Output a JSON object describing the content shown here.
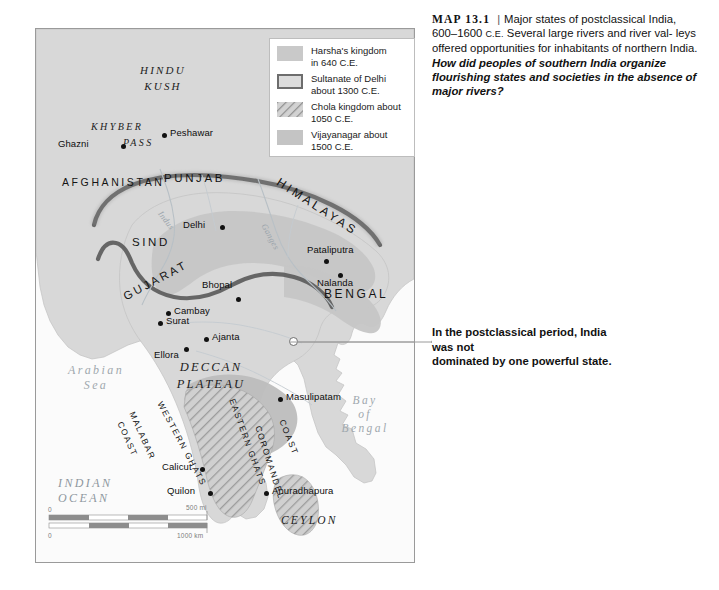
{
  "caption": {
    "map_number": "MAP 13.1",
    "divider": "|",
    "line1": "Major states of postclassical",
    "line2_a": "India, 600–1600 ",
    "line2_era": "C.E.",
    "line2_b": " Several large rivers and river val-",
    "line3": "leys offered opportunities for inhabitants of northern",
    "line4_a": "India. ",
    "question": "How did peoples of southern India organize flourishing states and societies in the absence of major rivers?"
  },
  "legend": {
    "items": [
      {
        "swatch": "solid-gray-fill",
        "line1": "Harsha's kingdom",
        "line2": "in 640 C.E."
      },
      {
        "swatch": "dark-outlined-box",
        "line1": "Sultanate of Delhi",
        "line2": "about 1300 C.E."
      },
      {
        "swatch": "diagonal-hatch",
        "line1": "Chola kingdom about",
        "line2": "1050 C.E."
      },
      {
        "swatch": "solid-gray-fill",
        "line1": "Vijayanagar about",
        "line2": "1500 C.E."
      }
    ]
  },
  "annotation": {
    "line1": "In the postclassical period, India was not",
    "line2": "dominated by one powerful state."
  },
  "map": {
    "regions": [
      {
        "name": "hindu-kush",
        "line1": "HINDU",
        "line2": "KUSH"
      },
      {
        "name": "deccan-plateau",
        "line1": "DECCAN",
        "line2": "PLATEAU"
      },
      {
        "name": "khyber-pass",
        "line1": "KHYBER",
        "line2": "PASS"
      },
      {
        "name": "ceylon",
        "line1": "CEYLON"
      }
    ],
    "provinces": [
      {
        "name": "afghanistan",
        "label": "AFGHANISTAN"
      },
      {
        "name": "punjab",
        "label": "PUNJAB"
      },
      {
        "name": "sind",
        "label": "SIND"
      },
      {
        "name": "gujarat",
        "label": "GUJARAT"
      },
      {
        "name": "bengal",
        "label": "BENGAL"
      },
      {
        "name": "himalayas",
        "label": "HIMALAYAS"
      }
    ],
    "cities": [
      {
        "name": "peshawar",
        "label": "Peshawar"
      },
      {
        "name": "ghazni",
        "label": "Ghazni"
      },
      {
        "name": "delhi",
        "label": "Delhi"
      },
      {
        "name": "pataliputra",
        "label": "Pataliputra"
      },
      {
        "name": "nalanda",
        "label": "Nalanda"
      },
      {
        "name": "bhopal",
        "label": "Bhopal"
      },
      {
        "name": "cambay",
        "label": "Cambay"
      },
      {
        "name": "surat",
        "label": "Surat"
      },
      {
        "name": "ajanta",
        "label": "Ajanta"
      },
      {
        "name": "ellora",
        "label": "Ellora"
      },
      {
        "name": "masulipatam",
        "label": "Masulipatam"
      },
      {
        "name": "calicut",
        "label": "Calicut"
      },
      {
        "name": "quilon",
        "label": "Quilon"
      },
      {
        "name": "anuradhapura",
        "label": "Anuradhapura"
      }
    ],
    "seas": [
      {
        "name": "arabian-sea",
        "line1": "Arabian",
        "line2": "Sea"
      },
      {
        "name": "bay-of-bengal",
        "line1": "Bay",
        "line2": "of",
        "line3": "Bengal"
      },
      {
        "name": "indian-ocean",
        "line1": "INDIAN",
        "line2": "OCEAN"
      }
    ],
    "rivers": [
      {
        "name": "indus",
        "label": "Indus"
      },
      {
        "name": "ganges",
        "label": "Ganges"
      }
    ],
    "coasts": [
      {
        "name": "western-ghats",
        "label": "WESTERN GHATS"
      },
      {
        "name": "eastern-ghats",
        "label": "EASTERN GHATS"
      },
      {
        "name": "malabar-coast",
        "line1": "MALABAR",
        "line2": "COAST"
      },
      {
        "name": "coromandel-coast",
        "line1": "COROMANDEL",
        "line2": "COAST"
      }
    ],
    "scale": {
      "miles_start": "0",
      "miles_end": "500 mi",
      "km_start": "0",
      "km_end": "1000 km"
    }
  },
  "colors": {
    "land": "#d6d6d6",
    "harsha": "#c4c4c4",
    "vijayanagar": "#bfbfbf",
    "sultanate_border": "#5e5e5e",
    "water": "#fbfbfb",
    "frame": "#9a9a9a"
  }
}
